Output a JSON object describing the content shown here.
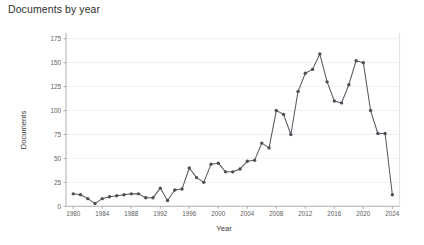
{
  "chart_data": {
    "type": "line",
    "title": "Documents by year",
    "xlabel": "Year",
    "ylabel": "Documents",
    "grid": true,
    "legend": false,
    "xlim": [
      1979,
      2025
    ],
    "ylim": [
      0,
      181
    ],
    "yticks": [
      0,
      25,
      50,
      75,
      100,
      125,
      150,
      175
    ],
    "xticks": [
      1980,
      1984,
      1988,
      1992,
      1996,
      2000,
      2004,
      2008,
      2012,
      2016,
      2020,
      2024
    ],
    "marker": "circle",
    "line_color": "#555a60",
    "marker_color": "#4c5157",
    "x": [
      1980,
      1981,
      1982,
      1983,
      1984,
      1985,
      1986,
      1987,
      1988,
      1989,
      1990,
      1991,
      1992,
      1993,
      1994,
      1995,
      1996,
      1997,
      1998,
      1999,
      2000,
      2001,
      2002,
      2003,
      2004,
      2005,
      2006,
      2007,
      2008,
      2009,
      2010,
      2011,
      2012,
      2013,
      2014,
      2015,
      2016,
      2017,
      2018,
      2019,
      2020,
      2021,
      2022,
      2023,
      2024
    ],
    "values": [
      13,
      12,
      8,
      3,
      8,
      10,
      11,
      12,
      13,
      13,
      9,
      9,
      19,
      6,
      17,
      18,
      40,
      30,
      25,
      44,
      45,
      36,
      36,
      39,
      47,
      48,
      66,
      61,
      100,
      96,
      75,
      120,
      139,
      143,
      159,
      130,
      110,
      108,
      127,
      152,
      150,
      100,
      76,
      76,
      12
    ],
    "series": [
      {
        "name": "Documents",
        "values": [
          13,
          12,
          8,
          3,
          8,
          10,
          11,
          12,
          13,
          13,
          9,
          9,
          19,
          6,
          17,
          18,
          40,
          30,
          25,
          44,
          45,
          36,
          36,
          39,
          47,
          48,
          66,
          61,
          100,
          96,
          75,
          120,
          139,
          143,
          159,
          130,
          110,
          108,
          127,
          152,
          150,
          100,
          76,
          76,
          12
        ]
      }
    ]
  }
}
